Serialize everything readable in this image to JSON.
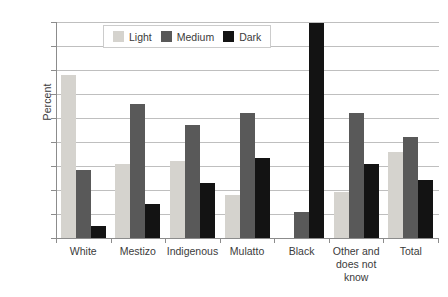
{
  "chart_data": {
    "type": "bar",
    "title": "",
    "xlabel": "",
    "ylabel": "Percent",
    "ylim": [
      0,
      90
    ],
    "yticks": [
      0,
      10,
      20,
      30,
      40,
      50,
      60,
      70,
      80,
      90
    ],
    "grid": true,
    "legend_position": "top-center",
    "categories": [
      "White",
      "Mestizo",
      "Indigenous",
      "Mulatto",
      "Black",
      "Other and does not know",
      "Total"
    ],
    "series": [
      {
        "name": "Light",
        "color": "#d5d3ce",
        "values": [
          68,
          31,
          32,
          18,
          0,
          19,
          36
        ]
      },
      {
        "name": "Medium",
        "color": "#595959",
        "values": [
          28.5,
          56,
          47,
          52,
          11,
          52,
          42
        ]
      },
      {
        "name": "Dark",
        "color": "#131313",
        "values": [
          5,
          14,
          23,
          33.5,
          89.5,
          31,
          24
        ]
      }
    ]
  },
  "axis": {
    "y_title": "Percent",
    "y_tick_labels": [
      "90",
      "80",
      "70",
      "60",
      "50",
      "40",
      "30",
      "20",
      "10",
      "0"
    ],
    "x_tick_labels": [
      {
        "lines": [
          "White"
        ]
      },
      {
        "lines": [
          "Mestizo"
        ]
      },
      {
        "lines": [
          "Indigenous"
        ]
      },
      {
        "lines": [
          "Mulatto"
        ]
      },
      {
        "lines": [
          "Black"
        ]
      },
      {
        "lines": [
          "Other and",
          "does not",
          "know"
        ]
      },
      {
        "lines": [
          "Total"
        ]
      }
    ]
  },
  "legend": {
    "entries": [
      {
        "label": "Light",
        "color": "#d5d3ce"
      },
      {
        "label": "Medium",
        "color": "#595959"
      },
      {
        "label": "Dark",
        "color": "#131313"
      }
    ]
  }
}
